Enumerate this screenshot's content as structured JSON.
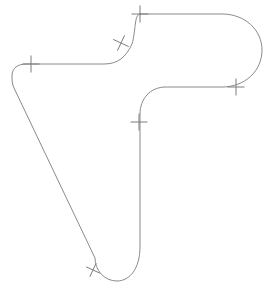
{
  "canvas": {
    "width": 268,
    "height": 287,
    "background_color": "#ffffff",
    "title": "Rounded closed outline shape with perpendicular tick marks"
  },
  "shape": {
    "name": "closed-rounded-outline",
    "stroke_color": "#8a8a8a",
    "stroke_width": 1,
    "fill": "none",
    "path": "M 140 14 L 222 14 C 245 14 262 30 262 50 C 262 71 245 87 222 87 L 166 87 C 150 87 140 99 140 114 L 140 247 C 140 268 130 281 117 281 C 104 281 95 270 95 258 L 14 88 C 12 84 12 80 12 76 C 12 68 18 64 26 64 L 104 64 C 118 64 126 57 132 44 C 136 31 134 14 140 14 Z",
    "description": "Boomerang / L-shaped closed contour with rounded corners, a semicircular right cap, a vertical stem, a U-shaped bottom and a long diagonal on the left"
  },
  "tick_marks": [
    {
      "id": "tick-top",
      "name": "tick-top-edge",
      "x": 140,
      "y": 14,
      "angle_deg": 0,
      "length": 17
    },
    {
      "id": "tick-shoulder",
      "name": "tick-upper-s-curve",
      "x": 121,
      "y": 43,
      "angle_deg": 25,
      "length": 17
    },
    {
      "id": "tick-left",
      "name": "tick-left-horizontal-edge",
      "x": 31,
      "y": 64,
      "angle_deg": 0,
      "length": 17
    },
    {
      "id": "tick-right",
      "name": "tick-right-inner-edge",
      "x": 236,
      "y": 87,
      "angle_deg": 0,
      "length": 17
    },
    {
      "id": "tick-stem",
      "name": "tick-vertical-stem",
      "x": 139,
      "y": 122,
      "angle_deg": 90,
      "length": 17
    },
    {
      "id": "tick-diagonal",
      "name": "tick-lower-diagonal-edge",
      "x": 93,
      "y": 270,
      "angle_deg": 115,
      "length": 15
    }
  ]
}
